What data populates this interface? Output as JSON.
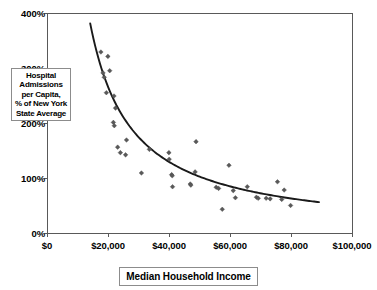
{
  "chart_data": {
    "type": "scatter",
    "title": "",
    "subtitle": "",
    "xlabel": "Median Household Income",
    "ylabel": "Hospital Admissions per Capita, % of New York State Average",
    "ylabel_lines": [
      "Hospital",
      "Admissions",
      "per Capita,",
      "% of New York",
      "State Average"
    ],
    "xlim": [
      0,
      100000
    ],
    "ylim": [
      0,
      400
    ],
    "xticks": [
      0,
      20000,
      40000,
      60000,
      80000,
      100000
    ],
    "xtick_labels": [
      "$0",
      "$20,000",
      "$40,000",
      "$60,000",
      "$80,000",
      "$100,000"
    ],
    "yticks": [
      0,
      100,
      200,
      300,
      400
    ],
    "ytick_labels": [
      "0%",
      "100%",
      "200%",
      "300%",
      "400%"
    ],
    "grid": false,
    "legend": "none",
    "marker_shape": "diamond",
    "marker_color": "#595959",
    "curve_color": "#1a1a1a",
    "axis_color": "#595959",
    "background_color": "#ffffff",
    "series": [
      {
        "name": "Counties",
        "points": [
          [
            17500,
            330
          ],
          [
            18200,
            292
          ],
          [
            18600,
            284
          ],
          [
            19800,
            322
          ],
          [
            20400,
            296
          ],
          [
            19300,
            256
          ],
          [
            21800,
            250
          ],
          [
            22300,
            228
          ],
          [
            21600,
            202
          ],
          [
            21900,
            196
          ],
          [
            23000,
            157
          ],
          [
            23900,
            147
          ],
          [
            25900,
            170
          ],
          [
            25600,
            143
          ],
          [
            30800,
            110
          ],
          [
            33400,
            153
          ],
          [
            39800,
            147
          ],
          [
            39900,
            135
          ],
          [
            40700,
            107
          ],
          [
            40900,
            105
          ],
          [
            41000,
            85
          ],
          [
            46800,
            90
          ],
          [
            47000,
            88
          ],
          [
            48400,
            112
          ],
          [
            48700,
            167
          ],
          [
            55300,
            84
          ],
          [
            56100,
            82
          ],
          [
            57300,
            44
          ],
          [
            59500,
            124
          ],
          [
            60900,
            78
          ],
          [
            61600,
            65
          ],
          [
            65500,
            85
          ],
          [
            68500,
            66
          ],
          [
            69100,
            64
          ],
          [
            71700,
            64
          ],
          [
            73000,
            63
          ],
          [
            75400,
            94
          ],
          [
            76800,
            62
          ],
          [
            77600,
            79
          ],
          [
            79700,
            51
          ]
        ]
      }
    ],
    "trendline": {
      "type": "power",
      "description": "decreasing power-law fit",
      "x_start": 14000,
      "x_end": 89000,
      "y_start": 382,
      "y_end": 57
    }
  },
  "axis_titles": {
    "x": "Median Household Income",
    "y_box_lines": [
      "Hospital",
      "Admissions",
      "per Capita,",
      "% of New York",
      "State Average"
    ]
  }
}
